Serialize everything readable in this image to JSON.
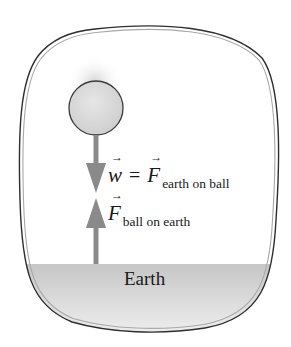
{
  "diagram": {
    "ball": {
      "fill": "#d8d8d8",
      "stroke": "#3a3a3a"
    },
    "arrow_color": "#888888",
    "ground": {
      "label": "Earth",
      "fill_top": "#c9c9c9",
      "fill_bottom": "#f4f4f4"
    },
    "border": {
      "outer": "#2e2e2e",
      "inner": "#a8a8a8"
    },
    "forces": [
      {
        "direction": "down",
        "lhs_symbol": "w",
        "equals": "=",
        "rhs_symbol": "F",
        "rhs_subscript": "earth on ball"
      },
      {
        "direction": "up",
        "symbol": "F",
        "subscript": "ball on earth"
      }
    ]
  }
}
